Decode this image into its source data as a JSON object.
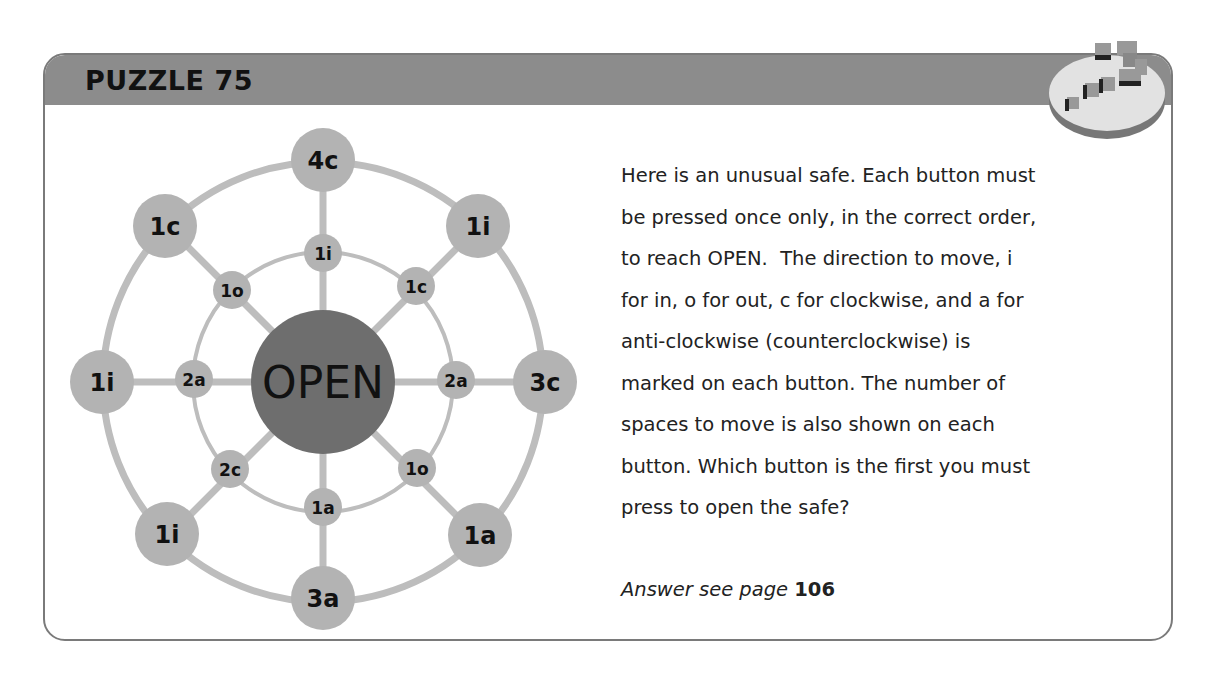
{
  "header": {
    "title": "PUZZLE 75"
  },
  "diagram": {
    "center_label": "OPEN",
    "outer_buttons": [
      {
        "id": "outer-n",
        "label": "4c",
        "pos": "top"
      },
      {
        "id": "outer-ne",
        "label": "1i",
        "pos": "top-right"
      },
      {
        "id": "outer-e",
        "label": "3c",
        "pos": "right"
      },
      {
        "id": "outer-se",
        "label": "1a",
        "pos": "bottom-right"
      },
      {
        "id": "outer-s",
        "label": "3a",
        "pos": "bottom"
      },
      {
        "id": "outer-sw",
        "label": "1i",
        "pos": "bottom-left"
      },
      {
        "id": "outer-w",
        "label": "1i",
        "pos": "left"
      },
      {
        "id": "outer-nw",
        "label": "1c",
        "pos": "top-left"
      }
    ],
    "inner_buttons": [
      {
        "id": "inner-n",
        "label": "1i",
        "pos": "top"
      },
      {
        "id": "inner-ne",
        "label": "1c",
        "pos": "top-right"
      },
      {
        "id": "inner-e",
        "label": "2a",
        "pos": "right"
      },
      {
        "id": "inner-se",
        "label": "1o",
        "pos": "bottom-right"
      },
      {
        "id": "inner-s",
        "label": "1a",
        "pos": "bottom"
      },
      {
        "id": "inner-sw",
        "label": "2c",
        "pos": "bottom-left"
      },
      {
        "id": "inner-w",
        "label": "2a",
        "pos": "left"
      },
      {
        "id": "inner-nw",
        "label": "1o",
        "pos": "top-left"
      }
    ],
    "colors": {
      "button": "#b3b3b3",
      "ring": "#bdbdbd",
      "center": "#6e6e6e",
      "label": "#111111"
    }
  },
  "text": {
    "lines": [
      "Here is an unusual safe. Each button must",
      "be pressed once only, in the correct order,",
      "to reach OPEN.  The direction to move, i",
      "for in, o for out, c for clockwise, and a for",
      "anti-clockwise (counterclockwise) is",
      "marked on each button. The number of",
      "spaces to move is also shown on each",
      "button. Which button is the first you must",
      "press to open the safe?"
    ],
    "answer_lead": "Answer see page ",
    "answer_page": "106"
  }
}
